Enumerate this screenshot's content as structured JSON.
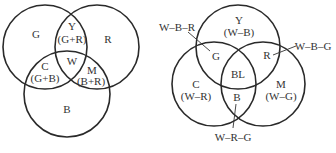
{
  "additive_diagram": {
    "circles": [
      {
        "name": "G",
        "cx": 45,
        "cy": 47,
        "r": 42
      },
      {
        "name": "R",
        "cx": 97,
        "cy": 47,
        "r": 42
      },
      {
        "name": "B",
        "cx": 67,
        "cy": 94,
        "r": 43
      }
    ],
    "labels": {
      "g": "G",
      "r": "R",
      "b": "B",
      "y": "Y",
      "y_mix": "(G+R)",
      "c": "C",
      "c_mix": "(G+B)",
      "m": "M",
      "m_mix": "(B+R)",
      "w": "W"
    }
  },
  "subtractive_diagram": {
    "circles": [
      {
        "name": "Y",
        "cx": 238,
        "cy": 47,
        "r": 42
      },
      {
        "name": "C",
        "cx": 214,
        "cy": 84,
        "r": 42
      },
      {
        "name": "M",
        "cx": 263,
        "cy": 84,
        "r": 42
      }
    ],
    "labels": {
      "y": "Y",
      "y_mix": "(W–B)",
      "c": "C",
      "c_mix": "(W–R)",
      "m": "M",
      "m_mix": "(W–G)",
      "g": "G",
      "r": "R",
      "b": "B",
      "bl": "BL",
      "g_callout": "W–B–R",
      "r_callout": "W–B–G",
      "b_callout": "W–R–G"
    }
  },
  "colors": {
    "stroke": "#2a2a2a",
    "text": "#333333",
    "background": "#ffffff"
  }
}
